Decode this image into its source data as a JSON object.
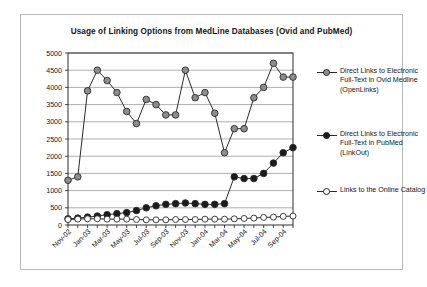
{
  "chart_data": {
    "type": "line",
    "title": "Usage of Linking Options from MedLine Databases (Ovid and PubMed)",
    "xlabel": "",
    "ylabel": "",
    "ylim": [
      0,
      5000
    ],
    "ytick_step": 500,
    "yticks": [
      "0",
      "500",
      "1000",
      "1500",
      "2000",
      "2500",
      "3000",
      "3500",
      "4000",
      "4500",
      "5000"
    ],
    "grid": true,
    "legend_position": "right",
    "x": [
      "Nov-02",
      "Dec-02",
      "Jan-03",
      "Feb-03",
      "Mar-03",
      "Apr-03",
      "May-03",
      "Jun-03",
      "Jul-03",
      "Aug-03",
      "Sep-03",
      "Oct-03",
      "Nov-03",
      "Dec-03",
      "Jan-04",
      "Feb-04",
      "Mar-04",
      "Apr-04",
      "May-04",
      "Jun-04",
      "Jul-04",
      "Aug-04",
      "Sep-04",
      "Oct-04"
    ],
    "xtick_labels_shown": [
      "Nov-02",
      "Jan-03",
      "Mar-03",
      "May-03",
      "Jul-03",
      "Sep-03",
      "Nov-03",
      "Jan-04",
      "Mar-04",
      "May-04",
      "Jul-04",
      "Sep-04"
    ],
    "series": [
      {
        "name": "Direct Links to Electronic Full-Text in Ovid Medline (OpenLinks)",
        "marker": "filled-gray-circle",
        "color": "#8d8d8d",
        "values": [
          1300,
          1400,
          3900,
          4500,
          4200,
          3850,
          3300,
          2950,
          3650,
          3500,
          3200,
          3200,
          4500,
          3700,
          3850,
          3250,
          2100,
          2800,
          2800,
          3700,
          4000,
          4700,
          4300,
          4300
        ]
      },
      {
        "name": "Direct Links to Electronic Full-Text in PubMed (LinkOut)",
        "marker": "filled-black-circle",
        "color": "#1b1b1b",
        "values": [
          180,
          200,
          230,
          260,
          300,
          330,
          360,
          420,
          500,
          560,
          600,
          620,
          640,
          620,
          600,
          600,
          620,
          1400,
          1350,
          1350,
          1500,
          1800,
          2100,
          2250
        ]
      },
      {
        "name": "Links to the Online Catalog",
        "marker": "open-circle",
        "color": "#ffffff",
        "values": [
          160,
          170,
          180,
          180,
          170,
          170,
          170,
          160,
          150,
          150,
          150,
          160,
          160,
          160,
          170,
          170,
          170,
          180,
          190,
          200,
          220,
          230,
          250,
          260
        ]
      }
    ]
  },
  "legend": {
    "items": [
      "Direct Links to Electronic Full-Text in Ovid Medline (OpenLinks)",
      "Direct Links to Electronic Full-Text in PubMed (LinkOut)",
      "Links to the Online Catalog"
    ]
  }
}
